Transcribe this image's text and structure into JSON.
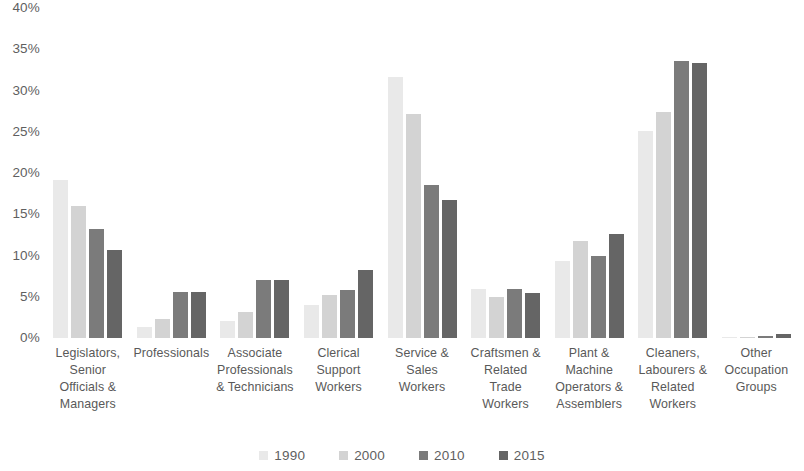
{
  "chart_data": {
    "type": "bar",
    "title": "",
    "subtitle": "",
    "xlabel": "",
    "ylabel": "",
    "ylim": [
      0,
      40
    ],
    "y_ticks": [
      "0%",
      "5%",
      "10%",
      "15%",
      "20%",
      "25%",
      "30%",
      "35%",
      "40%"
    ],
    "y_tick_values": [
      0,
      5,
      10,
      15,
      20,
      25,
      30,
      35,
      40
    ],
    "grid": false,
    "legend_position": "bottom",
    "categories": [
      "Legislators, Senior Officials & Managers",
      "Professionals",
      "Associate Professionals & Technicians",
      "Clerical Support Workers",
      "Service & Sales Workers",
      "Craftsmen & Related Trade Workers",
      "Plant & Machine Operators & Assemblers",
      "Cleaners, Labourers & Related Workers",
      "Other Occupation Groups"
    ],
    "category_lines": [
      [
        "Legislators,",
        "Senior",
        "Officials &",
        "Managers"
      ],
      [
        "Professionals"
      ],
      [
        "Associate",
        "Professionals",
        "& Technicians"
      ],
      [
        "Clerical",
        "Support",
        "Workers"
      ],
      [
        "Service &",
        "Sales",
        "Workers"
      ],
      [
        "Craftsmen &",
        "Related",
        "Trade",
        "Workers"
      ],
      [
        "Plant &",
        "Machine",
        "Operators &",
        "Assemblers"
      ],
      [
        "Cleaners,",
        "Labourers &",
        "Related",
        "Workers"
      ],
      [
        "Other",
        "Occupation",
        "Groups"
      ]
    ],
    "series": [
      {
        "name": "1990",
        "color": "#e9e9e9",
        "values": [
          19.1,
          1.3,
          2.1,
          4.0,
          31.6,
          6.0,
          9.3,
          25.1,
          0.1
        ]
      },
      {
        "name": "2000",
        "color": "#d3d3d3",
        "values": [
          16.0,
          2.3,
          3.2,
          5.2,
          27.2,
          5.0,
          11.7,
          27.4,
          0.1
        ]
      },
      {
        "name": "2010",
        "color": "#7b7b7b",
        "values": [
          13.2,
          5.6,
          7.0,
          5.8,
          18.5,
          6.0,
          9.9,
          33.6,
          0.3
        ]
      },
      {
        "name": "2015",
        "color": "#656565",
        "values": [
          10.7,
          5.6,
          7.0,
          8.2,
          16.7,
          5.5,
          12.6,
          33.3,
          0.5
        ]
      }
    ]
  }
}
